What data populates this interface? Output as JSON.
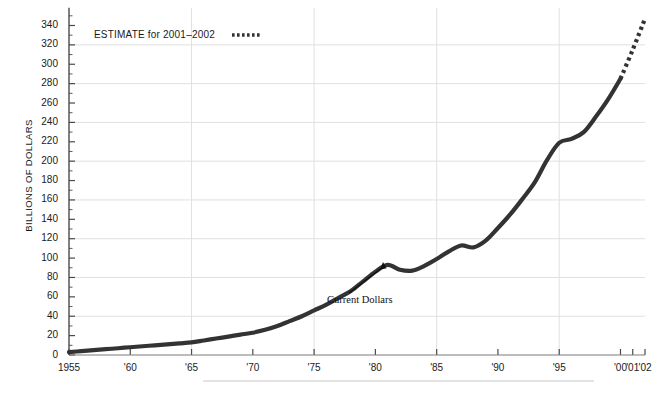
{
  "chart_data": {
    "type": "line",
    "title": "",
    "xlabel": "",
    "ylabel": "BILLIONS OF DOLLARS",
    "xlim": [
      1955,
      2002
    ],
    "ylim": [
      0,
      350
    ],
    "y_tick_step": 20,
    "y_minor_tick_step": 10,
    "grid": "horizontal gridlines every 40 units; vertical gridlines every 10 years",
    "legend_position": "top-left inside plot",
    "x_tick_labels": [
      "1955",
      "'60",
      "'65",
      "'70",
      "'75",
      "'80",
      "'85",
      "'90",
      "'95",
      "'00",
      "'01",
      "'02"
    ],
    "x_tick_values": [
      1955,
      1960,
      1965,
      1970,
      1975,
      1980,
      1985,
      1990,
      1995,
      2000,
      2001,
      2002
    ],
    "y_tick_labels": [
      "0",
      "20",
      "40",
      "60",
      "80",
      "100",
      "120",
      "140",
      "160",
      "180",
      "200",
      "220",
      "240",
      "260",
      "280",
      "300",
      "320",
      "340"
    ],
    "y_tick_values": [
      0,
      20,
      40,
      60,
      80,
      100,
      120,
      140,
      160,
      180,
      200,
      220,
      240,
      260,
      280,
      300,
      320,
      340
    ],
    "series": [
      {
        "name": "Current Dollars",
        "style": "solid",
        "color": "#333333",
        "x": [
          1955,
          1956,
          1957,
          1958,
          1959,
          1960,
          1961,
          1962,
          1963,
          1964,
          1965,
          1966,
          1967,
          1968,
          1969,
          1970,
          1971,
          1972,
          1973,
          1974,
          1975,
          1976,
          1977,
          1978,
          1979,
          1980,
          1981,
          1982,
          1983,
          1984,
          1985,
          1986,
          1987,
          1988,
          1989,
          1990,
          1991,
          1992,
          1993,
          1994,
          1995,
          1996,
          1997,
          1998,
          1999,
          2000
        ],
        "y": [
          3,
          4,
          5,
          6,
          7,
          8,
          9,
          10,
          11,
          12,
          13,
          15,
          17,
          19,
          21,
          23,
          26,
          30,
          35,
          40,
          46,
          52,
          59,
          66,
          76,
          86,
          93,
          88,
          87,
          92,
          99,
          107,
          113,
          111,
          118,
          131,
          145,
          161,
          178,
          201,
          219,
          223,
          230,
          246,
          264,
          285
        ]
      },
      {
        "name": "ESTIMATE for 2001-2002",
        "style": "dotted",
        "color": "#333333",
        "x": [
          2000,
          2001,
          2002
        ],
        "y": [
          285,
          315,
          347
        ]
      }
    ],
    "annotations": [
      {
        "text": "Current Dollars",
        "points_to_year": 1981,
        "points_to_value": 93
      }
    ]
  },
  "legend": {
    "estimate_label": "ESTIMATE for 2001–2002"
  },
  "annotation": {
    "current_dollars_label": "Current Dollars"
  },
  "axis": {
    "y_title": "BILLIONS OF DOLLARS"
  },
  "colors": {
    "line": "#333333",
    "grid": "#e0e0e0",
    "axis": "#4a4a4a",
    "text": "#1a1a1a"
  }
}
